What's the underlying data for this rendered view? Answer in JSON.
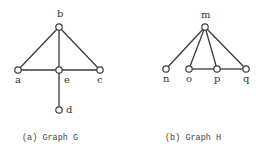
{
  "graphs": [
    {
      "id": "G",
      "caption": "(a) Graph G",
      "nodes": [
        {
          "id": "b",
          "label": "b",
          "x": 59,
          "y": 27,
          "lx": 57,
          "ly": 17
        },
        {
          "id": "a",
          "label": "a",
          "x": 18,
          "y": 70,
          "lx": 15,
          "ly": 83
        },
        {
          "id": "e",
          "label": "e",
          "x": 59,
          "y": 70,
          "lx": 64,
          "ly": 83
        },
        {
          "id": "c",
          "label": "c",
          "x": 100,
          "y": 70,
          "lx": 97,
          "ly": 83
        },
        {
          "id": "d",
          "label": "d",
          "x": 59,
          "y": 110,
          "lx": 66,
          "ly": 113
        }
      ],
      "edges": [
        [
          "b",
          "a"
        ],
        [
          "b",
          "e"
        ],
        [
          "b",
          "c"
        ],
        [
          "a",
          "e"
        ],
        [
          "e",
          "c"
        ],
        [
          "e",
          "d"
        ]
      ]
    },
    {
      "id": "H",
      "caption": "(b) Graph H",
      "nodes": [
        {
          "id": "m",
          "label": "m",
          "x": 205,
          "y": 27,
          "lx": 201,
          "ly": 18
        },
        {
          "id": "n",
          "label": "n",
          "x": 166,
          "y": 69,
          "lx": 163,
          "ly": 82
        },
        {
          "id": "o",
          "label": "o",
          "x": 189,
          "y": 69,
          "lx": 186,
          "ly": 82
        },
        {
          "id": "p",
          "label": "p",
          "x": 217,
          "y": 69,
          "lx": 214,
          "ly": 82
        },
        {
          "id": "q",
          "label": "q",
          "x": 246,
          "y": 69,
          "lx": 243,
          "ly": 82
        }
      ],
      "edges": [
        [
          "m",
          "n"
        ],
        [
          "m",
          "o"
        ],
        [
          "m",
          "p"
        ],
        [
          "m",
          "q"
        ],
        [
          "o",
          "p"
        ],
        [
          "p",
          "q"
        ]
      ]
    }
  ],
  "captions": {
    "a": "(a) Graph G",
    "b": "(b) Graph H"
  }
}
